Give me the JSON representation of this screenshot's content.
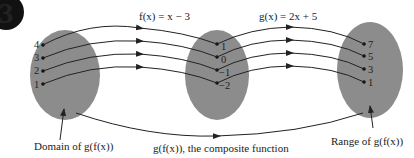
{
  "badge": {
    "label": "3"
  },
  "functions": {
    "f": "f(x) = x − 3",
    "g": "g(x) = 2x + 5"
  },
  "sets": {
    "domain": {
      "values": [
        "4",
        "3",
        "2",
        "1"
      ]
    },
    "middle": {
      "values": [
        "1",
        "0",
        "−1",
        "−2"
      ]
    },
    "range": {
      "values": [
        "7",
        "5",
        "3",
        "1"
      ]
    }
  },
  "labels": {
    "domain": "Domain of g(f(x))",
    "composite": "g(f(x)), the composite function",
    "range": "Range of g(f(x))"
  },
  "colors": {
    "oval": "#8c8c8c",
    "line": "#222222",
    "badge": "#111111"
  }
}
